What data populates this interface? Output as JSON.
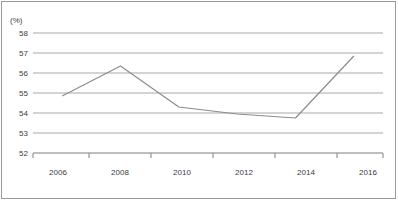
{
  "chart_data": {
    "type": "line",
    "title": "",
    "xlabel": "",
    "ylabel": "(%)",
    "unit_label": "(%)",
    "categories": [
      "2006",
      "2008",
      "2010",
      "2012",
      "2014",
      "2016"
    ],
    "x": [
      2006,
      2008,
      2010,
      2012,
      2014,
      2016
    ],
    "values": [
      54.85,
      56.35,
      54.3,
      53.95,
      53.75,
      56.85
    ],
    "series": [
      {
        "name": "",
        "values": [
          54.85,
          56.35,
          54.3,
          53.95,
          53.75,
          56.85
        ]
      }
    ],
    "ylim": [
      52,
      58
    ],
    "xlim": [
      2005,
      2017
    ],
    "yticks": [
      "58",
      "57",
      "56",
      "55",
      "54",
      "53",
      "52"
    ],
    "ytick_values": [
      58,
      57,
      56,
      55,
      54,
      53,
      52
    ],
    "xticks": [
      "2006",
      "2008",
      "2010",
      "2012",
      "2014",
      "2016"
    ],
    "xtick_values": [
      2006,
      2008,
      2010,
      2012,
      2014,
      2016
    ],
    "minor_xtick_values": [
      2005,
      2007,
      2009,
      2011,
      2013,
      2015,
      2017
    ],
    "grid": "horizontal",
    "legend": "none",
    "line_color": "#8c8c8c",
    "grid_color": "#a8a8a8",
    "axis_color": "#7f7f7f",
    "border_color": "#9a9a9a",
    "text_color": "#3c3c3c",
    "background_color": "#ffffff"
  }
}
